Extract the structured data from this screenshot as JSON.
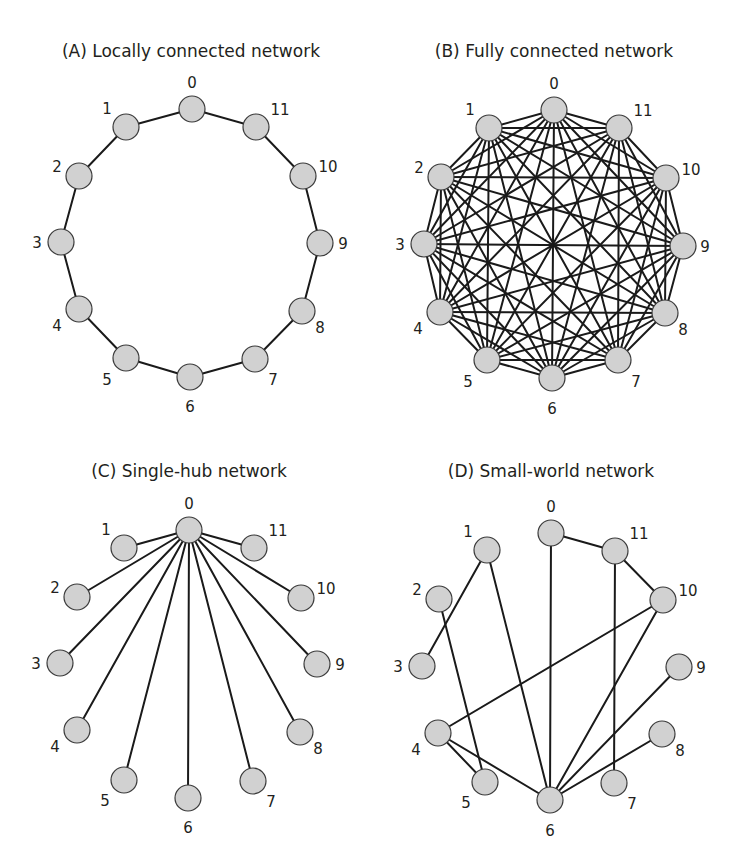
{
  "figure": {
    "width": 734,
    "height": 866,
    "colors": {
      "edge": "#1a1a1a",
      "node_fill": "#d1d1d1",
      "node_stroke": "#3a3a3a",
      "text": "#231f20"
    },
    "node_radius": 13
  },
  "panels": [
    {
      "id": "A",
      "title": "(A) Locally connected network",
      "title_x": 191,
      "title_y": 57,
      "edge_mode": "list",
      "nodes": [
        {
          "id": "0",
          "x": 192,
          "y": 109,
          "lx": 192,
          "ly": 83
        },
        {
          "id": "1",
          "x": 126,
          "y": 127,
          "lx": 107,
          "ly": 109
        },
        {
          "id": "2",
          "x": 79,
          "y": 176,
          "lx": 57,
          "ly": 167
        },
        {
          "id": "3",
          "x": 61,
          "y": 242,
          "lx": 37,
          "ly": 243
        },
        {
          "id": "4",
          "x": 79,
          "y": 309,
          "lx": 57,
          "ly": 326
        },
        {
          "id": "5",
          "x": 126,
          "y": 358,
          "lx": 107,
          "ly": 380
        },
        {
          "id": "6",
          "x": 190,
          "y": 377,
          "lx": 190,
          "ly": 407
        },
        {
          "id": "7",
          "x": 255,
          "y": 359,
          "lx": 273,
          "ly": 380
        },
        {
          "id": "8",
          "x": 302,
          "y": 311,
          "lx": 320,
          "ly": 328
        },
        {
          "id": "9",
          "x": 320,
          "y": 243,
          "lx": 343,
          "ly": 244
        },
        {
          "id": "10",
          "x": 303,
          "y": 176,
          "lx": 328,
          "ly": 167
        },
        {
          "id": "11",
          "x": 256,
          "y": 127,
          "lx": 280,
          "ly": 110
        }
      ],
      "edges": [
        [
          "0",
          "1"
        ],
        [
          "1",
          "2"
        ],
        [
          "2",
          "3"
        ],
        [
          "3",
          "4"
        ],
        [
          "4",
          "5"
        ],
        [
          "5",
          "6"
        ],
        [
          "6",
          "7"
        ],
        [
          "7",
          "8"
        ],
        [
          "8",
          "9"
        ],
        [
          "9",
          "10"
        ],
        [
          "10",
          "11"
        ],
        [
          "11",
          "0"
        ]
      ]
    },
    {
      "id": "B",
      "title": "(B) Fully connected network",
      "title_x": 554,
      "title_y": 57,
      "edge_mode": "complete",
      "nodes": [
        {
          "id": "0",
          "x": 554,
          "y": 110,
          "lx": 554,
          "ly": 84
        },
        {
          "id": "1",
          "x": 489,
          "y": 128,
          "lx": 470,
          "ly": 110
        },
        {
          "id": "2",
          "x": 441,
          "y": 177,
          "lx": 419,
          "ly": 168
        },
        {
          "id": "3",
          "x": 424,
          "y": 244,
          "lx": 400,
          "ly": 245
        },
        {
          "id": "4",
          "x": 440,
          "y": 312,
          "lx": 418,
          "ly": 329
        },
        {
          "id": "5",
          "x": 487,
          "y": 360,
          "lx": 468,
          "ly": 382
        },
        {
          "id": "6",
          "x": 552,
          "y": 378,
          "lx": 552,
          "ly": 409
        },
        {
          "id": "7",
          "x": 618,
          "y": 360,
          "lx": 636,
          "ly": 382
        },
        {
          "id": "8",
          "x": 665,
          "y": 313,
          "lx": 683,
          "ly": 330
        },
        {
          "id": "9",
          "x": 683,
          "y": 246,
          "lx": 705,
          "ly": 247
        },
        {
          "id": "10",
          "x": 666,
          "y": 178,
          "lx": 691,
          "ly": 170
        },
        {
          "id": "11",
          "x": 619,
          "y": 128,
          "lx": 643,
          "ly": 111
        }
      ],
      "edges": []
    },
    {
      "id": "C",
      "title": "(C) Single-hub network",
      "title_x": 189,
      "title_y": 477,
      "edge_mode": "list",
      "nodes": [
        {
          "id": "0",
          "x": 189,
          "y": 530,
          "lx": 189,
          "ly": 504
        },
        {
          "id": "1",
          "x": 124,
          "y": 548,
          "lx": 106,
          "ly": 530
        },
        {
          "id": "2",
          "x": 77,
          "y": 597,
          "lx": 55,
          "ly": 588
        },
        {
          "id": "3",
          "x": 60,
          "y": 663,
          "lx": 36,
          "ly": 664
        },
        {
          "id": "4",
          "x": 77,
          "y": 730,
          "lx": 55,
          "ly": 747
        },
        {
          "id": "5",
          "x": 124,
          "y": 780,
          "lx": 105,
          "ly": 801
        },
        {
          "id": "6",
          "x": 188,
          "y": 798,
          "lx": 188,
          "ly": 828
        },
        {
          "id": "7",
          "x": 253,
          "y": 781,
          "lx": 271,
          "ly": 802
        },
        {
          "id": "8",
          "x": 300,
          "y": 732,
          "lx": 318,
          "ly": 749
        },
        {
          "id": "9",
          "x": 317,
          "y": 664,
          "lx": 340,
          "ly": 665
        },
        {
          "id": "10",
          "x": 301,
          "y": 598,
          "lx": 326,
          "ly": 589
        },
        {
          "id": "11",
          "x": 254,
          "y": 548,
          "lx": 278,
          "ly": 531
        }
      ],
      "edges": [
        [
          "0",
          "1"
        ],
        [
          "0",
          "2"
        ],
        [
          "0",
          "3"
        ],
        [
          "0",
          "4"
        ],
        [
          "0",
          "5"
        ],
        [
          "0",
          "6"
        ],
        [
          "0",
          "7"
        ],
        [
          "0",
          "8"
        ],
        [
          "0",
          "9"
        ],
        [
          "0",
          "10"
        ],
        [
          "0",
          "11"
        ]
      ]
    },
    {
      "id": "D",
      "title": "(D) Small-world network",
      "title_x": 551,
      "title_y": 477,
      "edge_mode": "list",
      "nodes": [
        {
          "id": "0",
          "x": 551,
          "y": 533,
          "lx": 551,
          "ly": 507
        },
        {
          "id": "1",
          "x": 487,
          "y": 550,
          "lx": 468,
          "ly": 532
        },
        {
          "id": "2",
          "x": 439,
          "y": 599,
          "lx": 417,
          "ly": 590
        },
        {
          "id": "3",
          "x": 422,
          "y": 666,
          "lx": 398,
          "ly": 667
        },
        {
          "id": "4",
          "x": 438,
          "y": 733,
          "lx": 416,
          "ly": 750
        },
        {
          "id": "5",
          "x": 485,
          "y": 782,
          "lx": 466,
          "ly": 803
        },
        {
          "id": "6",
          "x": 550,
          "y": 800,
          "lx": 550,
          "ly": 831
        },
        {
          "id": "7",
          "x": 614,
          "y": 783,
          "lx": 632,
          "ly": 804
        },
        {
          "id": "8",
          "x": 662,
          "y": 734,
          "lx": 680,
          "ly": 751
        },
        {
          "id": "9",
          "x": 679,
          "y": 667,
          "lx": 701,
          "ly": 668
        },
        {
          "id": "10",
          "x": 663,
          "y": 600,
          "lx": 688,
          "ly": 591
        },
        {
          "id": "11",
          "x": 615,
          "y": 551,
          "lx": 639,
          "ly": 534
        }
      ],
      "edges": [
        [
          "0",
          "11"
        ],
        [
          "11",
          "10"
        ],
        [
          "0",
          "6"
        ],
        [
          "11",
          "7"
        ],
        [
          "1",
          "3"
        ],
        [
          "1",
          "6"
        ],
        [
          "2",
          "5"
        ],
        [
          "10",
          "4"
        ],
        [
          "10",
          "6"
        ],
        [
          "9",
          "6"
        ],
        [
          "8",
          "6"
        ],
        [
          "4",
          "5"
        ],
        [
          "4",
          "6"
        ]
      ]
    }
  ]
}
